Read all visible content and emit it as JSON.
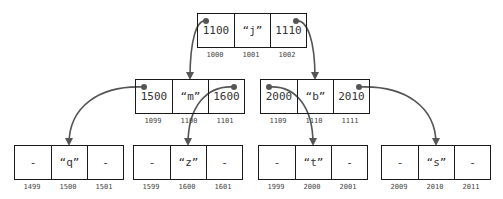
{
  "colors": {
    "arrow": "#555555",
    "border": "#1a1a1a"
  },
  "nodes": [
    {
      "id": "root",
      "cells": [
        "1100",
        "“j”",
        "1110"
      ],
      "addresses": [
        "1000",
        "1001",
        "1002"
      ]
    },
    {
      "id": "mid-left",
      "cells": [
        "1500",
        "“m”",
        "1600"
      ],
      "addresses": [
        "1099",
        "1100",
        "1101"
      ]
    },
    {
      "id": "mid-right",
      "cells": [
        "2000",
        "“b”",
        "2010"
      ],
      "addresses": [
        "1109",
        "1110",
        "1111"
      ]
    },
    {
      "id": "leaf-q",
      "cells": [
        "-",
        "“q”",
        "-"
      ],
      "addresses": [
        "1499",
        "1500",
        "1501"
      ]
    },
    {
      "id": "leaf-z",
      "cells": [
        "-",
        "“z”",
        "-"
      ],
      "addresses": [
        "1599",
        "1600",
        "1601"
      ]
    },
    {
      "id": "leaf-t",
      "cells": [
        "-",
        "“t”",
        "-"
      ],
      "addresses": [
        "1999",
        "2000",
        "2001"
      ]
    },
    {
      "id": "leaf-s",
      "cells": [
        "-",
        "“s”",
        "-"
      ],
      "addresses": [
        "2009",
        "2010",
        "2011"
      ]
    }
  ],
  "edges": [
    {
      "from": "root",
      "from_cell": 0,
      "to": "mid-left",
      "to_cell": 1
    },
    {
      "from": "root",
      "from_cell": 2,
      "to": "mid-right",
      "to_cell": 1
    },
    {
      "from": "mid-left",
      "from_cell": 0,
      "to": "leaf-q",
      "to_cell": 1
    },
    {
      "from": "mid-left",
      "from_cell": 2,
      "to": "leaf-z",
      "to_cell": 1
    },
    {
      "from": "mid-right",
      "from_cell": 0,
      "to": "leaf-t",
      "to_cell": 1
    },
    {
      "from": "mid-right",
      "from_cell": 2,
      "to": "leaf-s",
      "to_cell": 1
    }
  ]
}
